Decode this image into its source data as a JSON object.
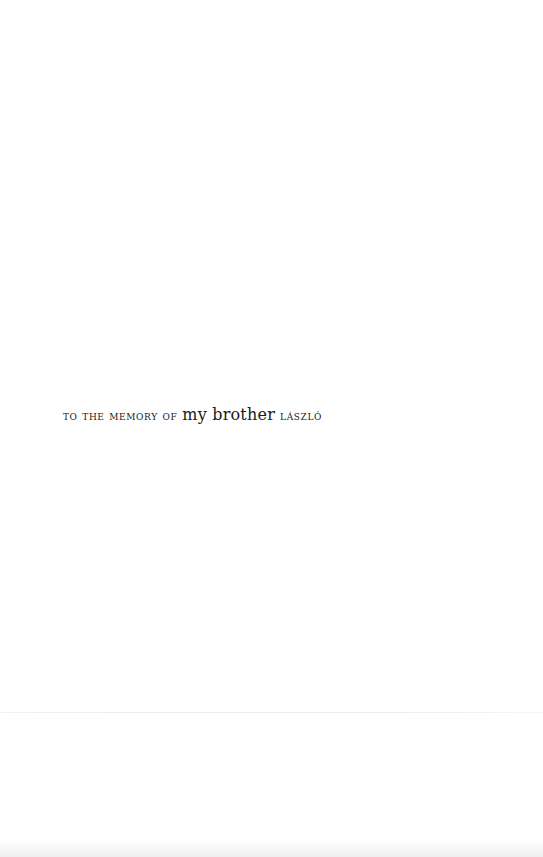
{
  "dedication": {
    "prefix": "To the memory of",
    "middle": "my brother",
    "name": "László"
  }
}
